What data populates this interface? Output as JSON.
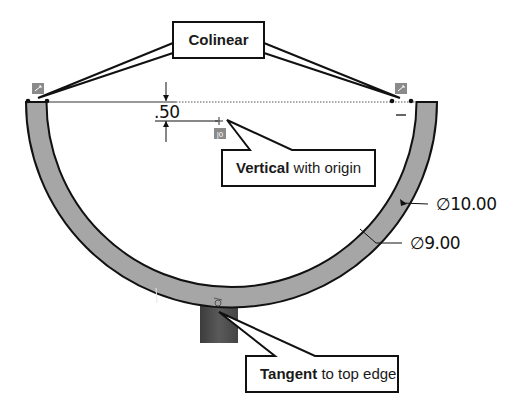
{
  "diagram": {
    "callouts": {
      "colinear": {
        "label": "Colinear"
      },
      "vertical": {
        "bold": "Vertical",
        "rest": " with origin"
      },
      "tangent": {
        "bold": "Tangent",
        "rest": " to top edge"
      }
    },
    "dimensions": {
      "offset": ".50",
      "outer_diameter": "∅10.00",
      "inner_diameter": "∅9.00"
    },
    "relation_glyphs": {
      "vertical_origin": "|0"
    },
    "colors": {
      "ring_fill": "#a6a6a6",
      "block_fill": "#4a4a4a",
      "badge_fill": "#8a8a8a",
      "line": "#111111"
    }
  }
}
